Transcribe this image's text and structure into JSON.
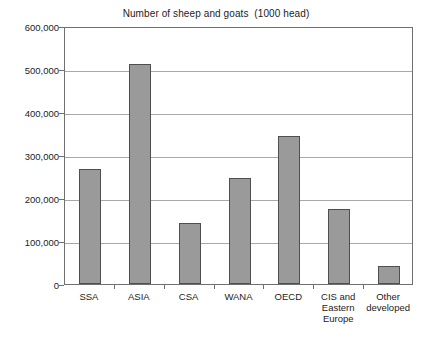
{
  "chart_data": {
    "type": "bar",
    "title": "Number of sheep and goats  (1000 head)",
    "xlabel": "",
    "ylabel": "",
    "ylim": [
      0,
      600000
    ],
    "ytick_step": 100000,
    "grid": true,
    "legend": false,
    "categories": [
      "SSA",
      "ASIA",
      "CSA",
      "WANA",
      "OECD",
      "CIS and\nEastern\nEurope",
      "Other\ndeveloped"
    ],
    "values": [
      268000,
      512000,
      143000,
      247000,
      345000,
      175000,
      42000
    ],
    "ytick_labels": [
      "600,000",
      "500,000",
      "400,000",
      "300,000",
      "200,000",
      "100,000",
      "0"
    ],
    "ytick_values": [
      600000,
      500000,
      400000,
      300000,
      200000,
      100000,
      0
    ],
    "bar_fill_color": "#9a9a9a",
    "bar_border_color": "#4f4f4f",
    "gridline_color": "#a8a8a8",
    "axis_color": "#6f6f6f",
    "text_color": "#1c1c1c",
    "background_color": "#ffffff"
  }
}
